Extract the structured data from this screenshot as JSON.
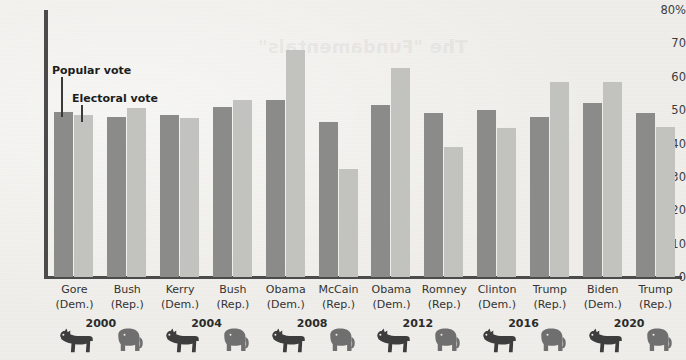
{
  "figure": {
    "watermark_text": "The \"Fundamentals\"",
    "background_color": "#efeeea",
    "axis_color": "#4b4b4b"
  },
  "annotations": [
    {
      "name": "popular-vote-annotation",
      "label": "Popular vote"
    },
    {
      "name": "electoral-vote-annotation",
      "label": "Electoral vote"
    }
  ],
  "mascots": {
    "democrat": "donkey-icon",
    "republican": "elephant-icon"
  },
  "chart_data": {
    "type": "bar",
    "title": "",
    "xlabel": "",
    "ylabel": "",
    "ylim": [
      0,
      80
    ],
    "yticks": [
      0,
      10,
      20,
      30,
      40,
      50,
      60,
      70,
      80
    ],
    "ytick_labels": [
      "0",
      "10",
      "20",
      "30",
      "40",
      "50",
      "60",
      "70",
      "80%"
    ],
    "grid": false,
    "legend_position": "inline-annotation",
    "series": [
      {
        "name": "Popular vote",
        "color": "#8b8b89",
        "values": [
          49.5,
          48.0,
          48.5,
          51.0,
          53.0,
          46.5,
          51.5,
          49.0,
          50.0,
          48.0,
          52.0,
          49.0
        ]
      },
      {
        "name": "Electoral vote",
        "color": "#c2c2bf",
        "values": [
          48.5,
          50.5,
          47.5,
          53.0,
          68.0,
          32.5,
          62.5,
          39.0,
          44.5,
          58.5,
          58.5,
          45.0
        ]
      }
    ],
    "categories": [
      {
        "candidate": "Gore",
        "party": "(Dem.)",
        "year": "2000",
        "mascot": "donkey-icon"
      },
      {
        "candidate": "Bush",
        "party": "(Rep.)",
        "year": "2000",
        "mascot": "elephant-icon"
      },
      {
        "candidate": "Kerry",
        "party": "(Dem.)",
        "year": "2004",
        "mascot": "donkey-icon"
      },
      {
        "candidate": "Bush",
        "party": "(Rep.)",
        "year": "2004",
        "mascot": "elephant-icon"
      },
      {
        "candidate": "Obama",
        "party": "(Dem.)",
        "year": "2008",
        "mascot": "donkey-icon"
      },
      {
        "candidate": "McCain",
        "party": "(Rep.)",
        "year": "2008",
        "mascot": "elephant-icon"
      },
      {
        "candidate": "Obama",
        "party": "(Dem.)",
        "year": "2012",
        "mascot": "donkey-icon"
      },
      {
        "candidate": "Romney",
        "party": "(Rep.)",
        "year": "2012",
        "mascot": "elephant-icon"
      },
      {
        "candidate": "Clinton",
        "party": "(Dem.)",
        "year": "2016",
        "mascot": "donkey-icon"
      },
      {
        "candidate": "Trump",
        "party": "(Rep.)",
        "year": "2016",
        "mascot": "elephant-icon"
      },
      {
        "candidate": "Biden",
        "party": "(Dem.)",
        "year": "2020",
        "mascot": "donkey-icon"
      },
      {
        "candidate": "Trump",
        "party": "(Rep.)",
        "year": "2020",
        "mascot": "elephant-icon"
      }
    ],
    "year_groups": [
      {
        "year": "2000",
        "start_index": 0
      },
      {
        "year": "2004",
        "start_index": 2
      },
      {
        "year": "2008",
        "start_index": 4
      },
      {
        "year": "2012",
        "start_index": 6
      },
      {
        "year": "2016",
        "start_index": 8
      },
      {
        "year": "2020",
        "start_index": 10
      }
    ]
  }
}
